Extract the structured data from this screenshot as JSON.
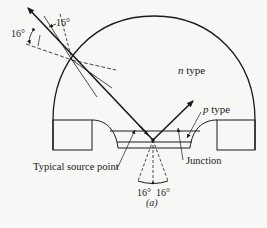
{
  "labels": {
    "n_type_var": "n",
    "n_type_word": " type",
    "p_type_var": "p",
    "p_type_word": " type",
    "source": "Typical source point",
    "junction": "Junction",
    "angle_top": "16°",
    "angle_left": "16°",
    "angle_bottom_left": "16°",
    "angle_bottom_right": "16°",
    "caption": "(a)"
  },
  "colors": {
    "stroke": "#1a1a1a",
    "background": "#f7f7f5"
  }
}
